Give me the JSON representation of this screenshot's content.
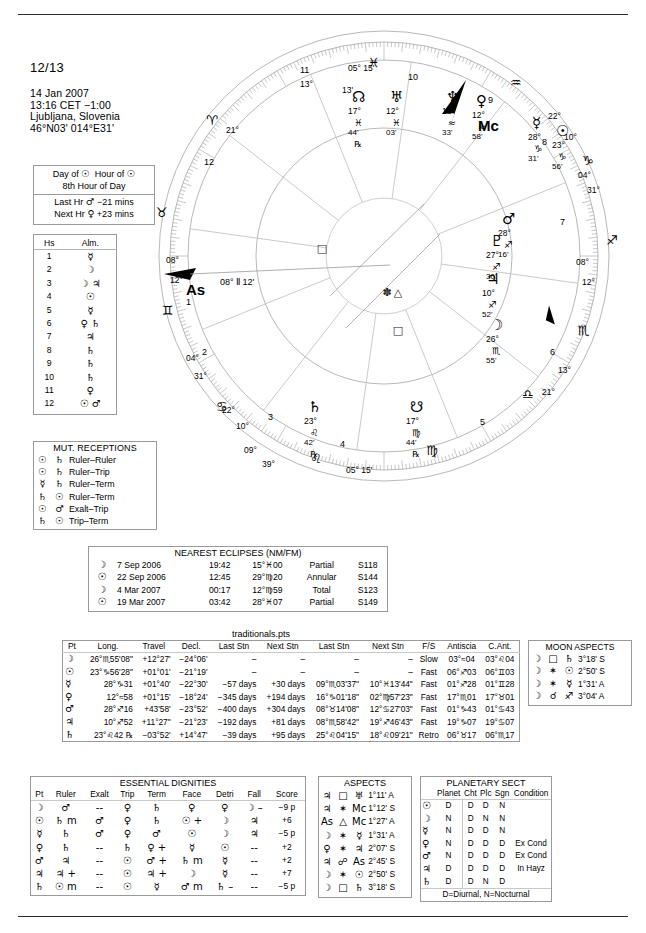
{
  "header": {
    "title": "12/13",
    "date": "14 Jan 2007",
    "time": "13:16  CET  −1:00",
    "place": "Ljubljana, Slovenia",
    "coords": "46°N03' 014°E31'"
  },
  "planetary_hour": {
    "line1_a": "Day of",
    "line1_sym_a": "☉",
    "line1_b": "Hour of",
    "line1_sym_b": "☉",
    "line2": "8th Hour of Day",
    "line3": "Last Hr",
    "line3_sym": "♂",
    "line3_val": "−21 mins",
    "line4": "Next Hr",
    "line4_sym": "♀",
    "line4_val": "+23 mins"
  },
  "houses_almuten": {
    "col1": "Hs",
    "col2": "Alm.",
    "rows": [
      {
        "hs": "1",
        "alm": "☿"
      },
      {
        "hs": "2",
        "alm": "☽"
      },
      {
        "hs": "3",
        "alm": "☽ ♃"
      },
      {
        "hs": "4",
        "alm": "☉"
      },
      {
        "hs": "5",
        "alm": "☿"
      },
      {
        "hs": "6",
        "alm": "♀ ♄"
      },
      {
        "hs": "7",
        "alm": "♃"
      },
      {
        "hs": "8",
        "alm": "♄"
      },
      {
        "hs": "9",
        "alm": "♄"
      },
      {
        "hs": "10",
        "alm": "♄"
      },
      {
        "hs": "11",
        "alm": "♀"
      },
      {
        "hs": "12",
        "alm": "☉ ♂"
      }
    ]
  },
  "mutual_receptions": {
    "title": "MUT. RECEPTIONS",
    "rows": [
      {
        "a": "☉",
        "b": "♄",
        "type": "Ruler–Ruler"
      },
      {
        "a": "☉",
        "b": "♄",
        "type": "Ruler–Trip"
      },
      {
        "a": "☿",
        "b": "♄",
        "type": "Ruler–Term"
      },
      {
        "a": "♄",
        "b": "☉",
        "type": "Ruler–Term"
      },
      {
        "a": "☉",
        "b": "♂",
        "type": "Exalt–Trip"
      },
      {
        "a": "♄",
        "b": "☉",
        "type": "Trip–Term"
      }
    ]
  },
  "eclipses": {
    "title": "NEAREST ECLIPSES (NM/FM)",
    "rows": [
      {
        "sym": "☽",
        "date": "7 Sep 2006",
        "time": "19:42",
        "pos": "15°♓00",
        "kind": "Partial",
        "saros": "S118"
      },
      {
        "sym": "☉",
        "date": "22 Sep 2006",
        "time": "12:45",
        "pos": "29°♍20",
        "kind": "Annular",
        "saros": "S144"
      },
      {
        "sym": "☽",
        "date": "4 Mar 2007",
        "time": "00:17",
        "pos": "12°♍59",
        "kind": "Total",
        "saros": "S123"
      },
      {
        "sym": "☉",
        "date": "19 Mar 2007",
        "time": "03:42",
        "pos": "28°♓07",
        "kind": "Partial",
        "saros": "S149"
      }
    ]
  },
  "traditionals": {
    "label": "traditionals.pts",
    "columns": [
      "Pt",
      "Long.",
      "Travel",
      "Decl.",
      "Last Stn",
      "Next Stn",
      "Last Stn",
      "Next Stn",
      "F/S",
      "Antiscia",
      "C.Ant."
    ],
    "rows": [
      {
        "pt": "☽",
        "long": "26°♏55'08\"",
        "travel": "+12°27'",
        "decl": "−24°06'",
        "laststn1": "–",
        "nextstn1": "–",
        "laststn2": "–",
        "nextstn2": "–",
        "fs": "Slow",
        "antiscia": "03°≈04",
        "cant": "03°♌04"
      },
      {
        "pt": "☉",
        "long": "23°♑56'28\"",
        "travel": "+01°01'",
        "decl": "−21°19'",
        "laststn1": "–",
        "nextstn1": "–",
        "laststn2": "–",
        "nextstn2": "–",
        "fs": "Fast",
        "antiscia": "06°♐03",
        "cant": "06°♊03"
      },
      {
        "pt": "☿",
        "long": "28°♑31",
        "travel": "+01°40'",
        "decl": "−22°30'",
        "laststn1": "−57 days",
        "nextstn1": "+30 days",
        "laststn2": "09°♏03'37\"",
        "nextstn2": "10°♓13'44\"",
        "fs": "Fast",
        "antiscia": "01°♐28",
        "cant": "01°♊28"
      },
      {
        "pt": "♀",
        "long": "12°≈58",
        "travel": "+01°15'",
        "decl": "−18°24'",
        "laststn1": "−345 days",
        "nextstn1": "+194 days",
        "laststn2": "16°♑01'18\"",
        "nextstn2": "02°♍57'23\"",
        "fs": "Fast",
        "antiscia": "17°♏01",
        "cant": "17°♉01"
      },
      {
        "pt": "♂",
        "long": "28°♐16",
        "travel": "+43'58'",
        "decl": "−23°52'",
        "laststn1": "−400 days",
        "nextstn1": "+304 days",
        "laststn2": "08°♉14'08\"",
        "nextstn2": "12°♋27'03\"",
        "fs": "Fast",
        "antiscia": "01°♑43",
        "cant": "01°♋43"
      },
      {
        "pt": "♃",
        "long": "10°♐52",
        "travel": "+11°27\"",
        "decl": "−21°23'",
        "laststn1": "−192 days",
        "nextstn1": "+81 days",
        "laststn2": "08°♏58'42\"",
        "nextstn2": "19°♐46'43\"",
        "fs": "Fast",
        "antiscia": "19°♑07",
        "cant": "19°♋07"
      },
      {
        "pt": "♄",
        "long": "23°♌42 ℞",
        "travel": "−03°52'",
        "decl": "+14°47'",
        "laststn1": "−39 days",
        "nextstn1": "+95 days",
        "laststn2": "25°♌04'15\"",
        "nextstn2": "18°♌09'21\"",
        "fs": "Retro",
        "antiscia": "06°♉17",
        "cant": "06°♏17"
      }
    ]
  },
  "moon_aspects": {
    "title": "MOON ASPECTS",
    "rows": [
      {
        "a": "☽",
        "asp": "□",
        "b": "♄",
        "orb": "3°18' S"
      },
      {
        "a": "☽",
        "asp": "✶",
        "b": "☉",
        "orb": "2°50' S"
      },
      {
        "a": "☽",
        "asp": "✶",
        "b": "☿",
        "orb": "1°31' A"
      },
      {
        "a": "☽",
        "asp": "☌",
        "b": "♐",
        "orb": "3°04' A"
      }
    ]
  },
  "essential_dignities": {
    "title": "ESSENTIAL DIGNITIES",
    "columns": [
      "Pt",
      "Ruler",
      "Exalt",
      "Trip",
      "Term",
      "Face",
      "Detri",
      "Fall",
      "Score"
    ],
    "rows": [
      {
        "pt": "☽",
        "ruler": "♂",
        "exalt": "--",
        "trip": "♀",
        "term": "♄",
        "face": "♀",
        "detri": "♀",
        "fall": "☽ –",
        "score": "−9 p"
      },
      {
        "pt": "☉",
        "ruler": "♄ m",
        "exalt": "♂",
        "trip": "♀",
        "term": "♄",
        "face": "☉ +",
        "detri": "☽",
        "fall": "♃",
        "score": "+6"
      },
      {
        "pt": "☿",
        "ruler": "♄",
        "exalt": "♂",
        "trip": "♀",
        "term": "♂",
        "face": "☉",
        "detri": "☽",
        "fall": "♃",
        "score": "−5 p"
      },
      {
        "pt": "♀",
        "ruler": "♄",
        "exalt": "--",
        "trip": "♄",
        "term": "♀ +",
        "face": "☿",
        "detri": "☉",
        "fall": "--",
        "score": "+2"
      },
      {
        "pt": "♂",
        "ruler": "♃",
        "exalt": "--",
        "trip": "☉",
        "term": "♂ +",
        "face": "♄ m",
        "detri": "☿",
        "fall": "--",
        "score": "+2"
      },
      {
        "pt": "♃",
        "ruler": "♃ +",
        "exalt": "--",
        "trip": "☉",
        "term": "♃ +",
        "face": "☽",
        "detri": "☿",
        "fall": "--",
        "score": "+7"
      },
      {
        "pt": "♄",
        "ruler": "☉ m",
        "exalt": "--",
        "trip": "☉",
        "term": "☿",
        "face": "♂ m",
        "detri": "♄ –",
        "fall": "--",
        "score": "−5 p"
      }
    ]
  },
  "aspects": {
    "title": "ASPECTS",
    "rows": [
      {
        "a": "♃",
        "asp": "□",
        "b": "♅",
        "orb": "1°11' A"
      },
      {
        "a": "♃",
        "asp": "✶",
        "b": "Mc",
        "orb": "1°12' S"
      },
      {
        "a": "As",
        "asp": "△",
        "b": "Mc",
        "orb": "1°27' A"
      },
      {
        "a": "☽",
        "asp": "✶",
        "b": "☿",
        "orb": "1°31' A"
      },
      {
        "a": "♀",
        "asp": "✶",
        "b": "♃",
        "orb": "2°07' S"
      },
      {
        "a": "♃",
        "asp": "☍",
        "b": "As",
        "orb": "2°45' S"
      },
      {
        "a": "☽",
        "asp": "✶",
        "b": "☉",
        "orb": "2°50' S"
      },
      {
        "a": "☽",
        "asp": "□",
        "b": "♄",
        "orb": "3°18' S"
      }
    ]
  },
  "planetary_sect": {
    "title": "PLANETARY SECT",
    "columns": [
      "Planet",
      "Cht",
      "Plc",
      "Sgn",
      "Condition"
    ],
    "footer": "D=Diurnal, N=Nocturnal",
    "rows": [
      {
        "sym": "☉",
        "planet": "D",
        "cht": "D",
        "plc": "D",
        "sgn": "N",
        "condition": ""
      },
      {
        "sym": "☽",
        "planet": "N",
        "cht": "D",
        "plc": "N",
        "sgn": "N",
        "condition": ""
      },
      {
        "sym": "☿",
        "planet": "N",
        "cht": "D",
        "plc": "D",
        "sgn": "N",
        "condition": ""
      },
      {
        "sym": "♀",
        "planet": "N",
        "cht": "D",
        "plc": "D",
        "sgn": "D",
        "condition": "Ex Cond"
      },
      {
        "sym": "♂",
        "planet": "N",
        "cht": "D",
        "plc": "D",
        "sgn": "D",
        "condition": "Ex Cond"
      },
      {
        "sym": "♃",
        "planet": "D",
        "cht": "D",
        "plc": "D",
        "sgn": "D",
        "condition": "In Hayz"
      },
      {
        "sym": "♄",
        "planet": "D",
        "cht": "D",
        "plc": "N",
        "sgn": "D",
        "condition": ""
      }
    ]
  },
  "wheel": {
    "mc_label": "Mc",
    "as_label": "As",
    "asc_text": "08° Ⅱ 12'",
    "cusps": [
      {
        "num": "10",
        "deg": "05°",
        "min": "15'"
      },
      {
        "num": "11",
        "deg": "13'",
        "min": ""
      },
      {
        "num": "9",
        "deg": "22°",
        "min": "10'"
      },
      {
        "num": "8",
        "deg": "04°",
        "min": "31'"
      },
      {
        "num": "7",
        "deg": "08°",
        "min": "12'"
      },
      {
        "num": "6",
        "deg": "13'",
        "min": ""
      },
      {
        "num": "5",
        "deg": "21°",
        "min": ""
      },
      {
        "num": "4",
        "deg": "05°",
        "min": "15'"
      },
      {
        "num": "3",
        "deg": "09°",
        "min": "39'"
      },
      {
        "num": "2",
        "deg": "22°",
        "min": "10'"
      },
      {
        "num": "1",
        "deg": "04°",
        "min": "31'"
      },
      {
        "num": "12",
        "deg": "08°",
        "min": "12'"
      }
    ],
    "planets": [
      {
        "glyph": "☊",
        "deg": "17°",
        "sign": "♓",
        "min": "44'",
        "retro": "℞"
      },
      {
        "glyph": "♅",
        "deg": "12°",
        "sign": "♓",
        "min": "03'",
        "retro": ""
      },
      {
        "glyph": "♆",
        "deg": "18°",
        "sign": "≈",
        "min": "33'",
        "retro": ""
      },
      {
        "glyph": "♀",
        "deg": "12°",
        "sign": "≈",
        "min": "58'",
        "retro": ""
      },
      {
        "glyph": "Mc",
        "deg": "09°",
        "sign": "≈",
        "min": "39'",
        "retro": ""
      },
      {
        "glyph": "☿",
        "deg": "28°",
        "sign": "♑",
        "min": "31'",
        "retro": ""
      },
      {
        "glyph": "☉",
        "deg": "23°",
        "sign": "♑",
        "min": "56'",
        "retro": ""
      },
      {
        "glyph": "♂",
        "deg": "28°",
        "sign": "♐",
        "min": "16'",
        "retro": ""
      },
      {
        "glyph": "♇",
        "deg": "27°",
        "sign": "♐",
        "min": "30'",
        "retro": ""
      },
      {
        "glyph": "♃",
        "deg": "10°",
        "sign": "♐",
        "min": "52'",
        "retro": ""
      },
      {
        "glyph": "☽",
        "deg": "26°",
        "sign": "♏",
        "min": "55'",
        "retro": ""
      },
      {
        "glyph": "♄",
        "deg": "23°",
        "sign": "♌",
        "min": "42'",
        "retro": "℞"
      },
      {
        "glyph": "☋",
        "deg": "17°",
        "sign": "♍",
        "min": "44'",
        "retro": "℞"
      }
    ],
    "sign_marks": [
      "♓",
      "≈",
      "♑",
      "♐",
      "♏",
      "♎",
      "♍",
      "♌",
      "♋",
      "♊",
      "♉",
      "♈",
      "♒"
    ],
    "ic_deg": "05°",
    "ic_min": "15'"
  },
  "colors": {
    "ink": "#000000",
    "line": "#9a9a9a",
    "faint": "#c9c9c9"
  }
}
